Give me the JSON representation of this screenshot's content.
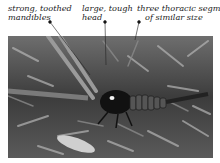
{
  "figure": {
    "labels": [
      {
        "id": "mandibles",
        "lines": [
          "strong, toothed",
          "mandibles"
        ]
      },
      {
        "id": "head",
        "lines": [
          "large, tough",
          "head"
        ]
      },
      {
        "id": "thorax",
        "lines": [
          "three thoracic segments",
          "of similar size"
        ]
      }
    ]
  }
}
